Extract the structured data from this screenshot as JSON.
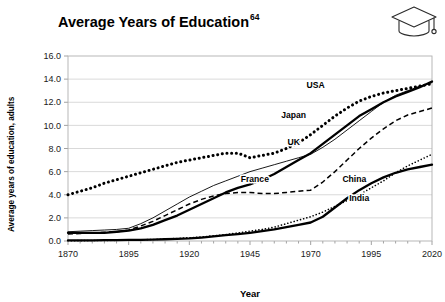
{
  "header": {
    "title": "Average Years of Education",
    "title_superscript": "64",
    "icon": "graduation-cap-icon"
  },
  "chart_data": {
    "type": "line",
    "title": "Average Years of Education",
    "title_superscript": "64",
    "xlabel": "Year",
    "ylabel": "Average years of education, adults",
    "xlim": [
      1870,
      2020
    ],
    "ylim": [
      0.0,
      16.0
    ],
    "xticks": [
      1870,
      1895,
      1920,
      1945,
      1970,
      1995,
      2020
    ],
    "xtick_labels": [
      "1870",
      "1895",
      "1920",
      "1945",
      "1970",
      "1995",
      "2020"
    ],
    "yticks": [
      0.0,
      2.0,
      4.0,
      6.0,
      8.0,
      10.0,
      12.0,
      14.0,
      16.0
    ],
    "ytick_labels": [
      "0.0",
      "2.0",
      "4.0",
      "6.0",
      "8.0",
      "10.0",
      "12.0",
      "14.0",
      "16.0"
    ],
    "grid": "horizontal",
    "legend_position": "inline-labels",
    "x": [
      1870,
      1875,
      1880,
      1885,
      1890,
      1895,
      1900,
      1905,
      1910,
      1915,
      1920,
      1925,
      1930,
      1935,
      1940,
      1945,
      1950,
      1955,
      1960,
      1965,
      1970,
      1975,
      1980,
      1985,
      1990,
      1995,
      2000,
      2005,
      2010,
      2015,
      2020
    ],
    "series": [
      {
        "name": "USA",
        "style": "dotted-thick",
        "color": "#000000",
        "label_x": 1972,
        "label_y": 13.2,
        "values": [
          4.0,
          4.3,
          4.6,
          5.0,
          5.3,
          5.6,
          5.9,
          6.2,
          6.5,
          6.8,
          7.0,
          7.2,
          7.4,
          7.6,
          7.6,
          7.2,
          7.4,
          7.6,
          8.0,
          8.5,
          9.2,
          10.0,
          10.8,
          11.5,
          12.1,
          12.5,
          12.8,
          13.0,
          13.2,
          13.4,
          13.6
        ]
      },
      {
        "name": "Japan",
        "style": "solid-thick",
        "color": "#000000",
        "label_x": 1963,
        "label_y": 10.6,
        "values": [
          0.7,
          0.7,
          0.7,
          0.7,
          0.8,
          0.9,
          1.1,
          1.4,
          1.8,
          2.2,
          2.7,
          3.2,
          3.7,
          4.2,
          4.6,
          4.9,
          5.3,
          5.8,
          6.4,
          7.0,
          7.6,
          8.4,
          9.2,
          10.0,
          10.8,
          11.4,
          12.0,
          12.5,
          12.9,
          13.3,
          13.8
        ]
      },
      {
        "name": "UK",
        "style": "solid-thin",
        "color": "#000000",
        "label_x": 1963,
        "label_y": 8.3,
        "values": [
          0.8,
          0.85,
          0.9,
          0.95,
          1.0,
          1.1,
          1.5,
          2.0,
          2.6,
          3.2,
          3.8,
          4.3,
          4.8,
          5.2,
          5.6,
          6.0,
          6.3,
          6.6,
          6.9,
          7.2,
          7.5,
          8.1,
          8.8,
          9.6,
          10.4,
          11.2,
          12.0,
          12.6,
          13.0,
          13.4,
          13.7
        ]
      },
      {
        "name": "France",
        "style": "dashed",
        "color": "#000000",
        "label_x": 1947,
        "label_y": 5.1,
        "values": [
          0.6,
          0.65,
          0.7,
          0.75,
          0.8,
          0.95,
          1.3,
          1.7,
          2.2,
          2.7,
          3.2,
          3.6,
          3.9,
          4.1,
          4.2,
          4.2,
          4.1,
          4.1,
          4.2,
          4.3,
          4.4,
          5.1,
          6.0,
          7.0,
          8.0,
          8.9,
          9.7,
          10.4,
          10.9,
          11.2,
          11.5
        ]
      },
      {
        "name": "China",
        "style": "solid-thick",
        "color": "#000000",
        "label_x": 1988,
        "label_y": 5.1,
        "values": [
          0.05,
          0.05,
          0.06,
          0.07,
          0.08,
          0.09,
          0.1,
          0.12,
          0.15,
          0.18,
          0.22,
          0.3,
          0.4,
          0.5,
          0.6,
          0.7,
          0.85,
          1.0,
          1.2,
          1.4,
          1.6,
          2.1,
          2.9,
          3.7,
          4.4,
          5.0,
          5.5,
          5.9,
          6.2,
          6.4,
          6.6
        ]
      },
      {
        "name": "India",
        "style": "dotted-fine",
        "color": "#000000",
        "label_x": 1990,
        "label_y": 3.5,
        "values": [
          0.02,
          0.03,
          0.04,
          0.05,
          0.06,
          0.08,
          0.1,
          0.13,
          0.17,
          0.22,
          0.28,
          0.35,
          0.45,
          0.55,
          0.7,
          0.85,
          1.0,
          1.2,
          1.5,
          1.8,
          2.1,
          2.5,
          3.0,
          3.5,
          4.0,
          4.6,
          5.2,
          5.9,
          6.5,
          7.0,
          7.5
        ]
      }
    ]
  }
}
